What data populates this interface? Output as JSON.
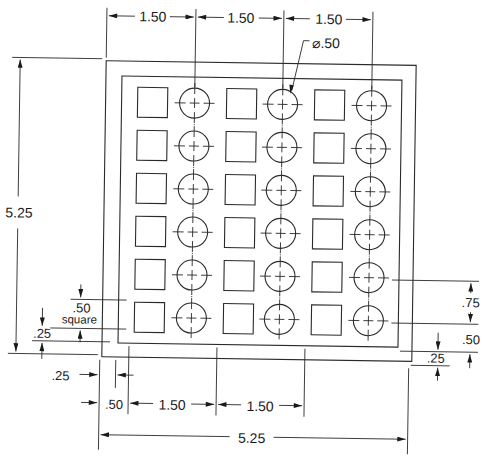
{
  "drawing": {
    "type": "engineering-plate-drawing",
    "units": "inches",
    "plate": {
      "width": "5.25",
      "height": "5.25"
    },
    "grid": {
      "rows": 6,
      "columns": 6,
      "pattern": [
        "square",
        "hole",
        "square",
        "hole",
        "square",
        "hole"
      ]
    },
    "dimensions": {
      "top_spacing_1": "1.50",
      "top_spacing_2": "1.50",
      "top_spacing_3": "1.50",
      "hole_diameter": "⌀.50",
      "overall_height": "5.25",
      "square_size": ".50",
      "square_label": "square",
      "left_inset": ".25",
      "bottom_left_inset": ".25",
      "bottom_first_offset": ".50",
      "bottom_spacing_1": "1.50",
      "bottom_spacing_2": "1.50",
      "overall_width": "5.25",
      "right_row_spacing": ".75",
      "right_bottom_offset": ".50",
      "right_inset": ".25"
    }
  }
}
